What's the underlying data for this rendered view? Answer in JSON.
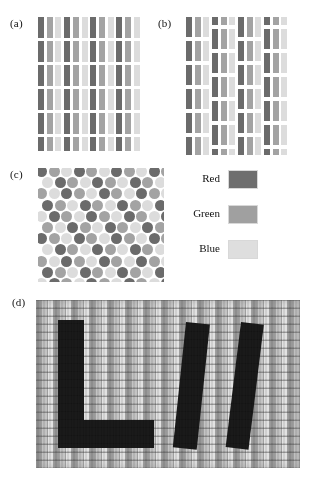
{
  "figure": {
    "kind": "subpixel-arrangement-figure",
    "background": "#ffffff",
    "panels": [
      {
        "id": "a",
        "label": "(a)",
        "label_x": 10,
        "label_y": 17,
        "type": "stripe-mosaic"
      },
      {
        "id": "b",
        "label": "(b)",
        "label_x": 158,
        "label_y": 17,
        "type": "delta-mosaic"
      },
      {
        "id": "c",
        "label": "(c)",
        "label_x": 10,
        "label_y": 168,
        "type": "dot-mosaic"
      },
      {
        "id": "d",
        "label": "(d)",
        "label_x": 12,
        "label_y": 296,
        "type": "display-micrograph"
      }
    ]
  },
  "colors": {
    "red_swatch": "#6e6e6e",
    "green_swatch": "#a0a0a0",
    "blue_swatch": "#dedede",
    "red_stripe": "#6b6b6b",
    "green_stripe": "#a3a3a3",
    "blue_stripe": "#dcdcdc",
    "letter_ink": "#1a1a1a",
    "micrograph_base": "#b9b9b9",
    "panel_background": "#ffffff",
    "text": "#111111"
  },
  "legend": {
    "items": [
      {
        "label": "Red",
        "swatch": "#6e6e6e",
        "top": 4
      },
      {
        "label": "Green",
        "swatch": "#a0a0a0",
        "top": 39
      },
      {
        "label": "Blue",
        "swatch": "#dedede",
        "top": 74
      }
    ]
  },
  "panel_a": {
    "columns": 12,
    "rows": 6,
    "cell_width": 6,
    "cell_pitch_x": 8.7,
    "row_tops": [
      0,
      24,
      48,
      72,
      96,
      120
    ],
    "row_heights": [
      21,
      21,
      21,
      21,
      21,
      14
    ],
    "sequence": [
      "red",
      "green",
      "blue"
    ]
  },
  "panel_b": {
    "column_groups": 4,
    "group_columns": 3,
    "cell_width": 6,
    "cell_height": 20,
    "row_pitch": 24,
    "offset_rows": "alternate groups shifted by half pitch",
    "sequence": [
      "red",
      "green",
      "blue"
    ]
  },
  "panel_c": {
    "dot_diameter": 11,
    "pitch_x": 12.5,
    "pitch_y": 11.2,
    "rows": 10,
    "columns": 10,
    "stagger": "half-pitch on odd rows",
    "sequence": [
      "red",
      "green",
      "blue"
    ]
  },
  "panel_d": {
    "text_on_display": "LW",
    "description": "magnified photograph of pixels on a display showing the letters",
    "grid_visible": true
  }
}
